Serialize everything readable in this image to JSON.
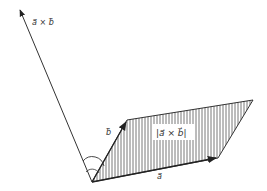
{
  "diagram": {
    "labels": {
      "cross_vector": "a⃗ × b⃗",
      "vector_a": "a⃗",
      "vector_b": "b⃗",
      "area": "|a⃗ × b⃗|"
    },
    "colors": {
      "stroke": "#333333",
      "hatch": "#777777",
      "background": "#ffffff"
    }
  }
}
